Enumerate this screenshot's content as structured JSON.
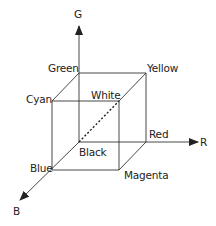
{
  "diagram": {
    "axes": {
      "g": "G",
      "r": "R",
      "b": "B"
    },
    "vertices": {
      "green": "Green",
      "yellow": "Yellow",
      "cyan": "Cyan",
      "white": "White",
      "red": "Red",
      "black": "Black",
      "blue": "Blue",
      "magenta": "Magenta"
    },
    "colors": {
      "line": "#333333",
      "text": "#222222",
      "background": "#ffffff"
    },
    "edges_note": "Dashed diagonal from Black to White"
  }
}
